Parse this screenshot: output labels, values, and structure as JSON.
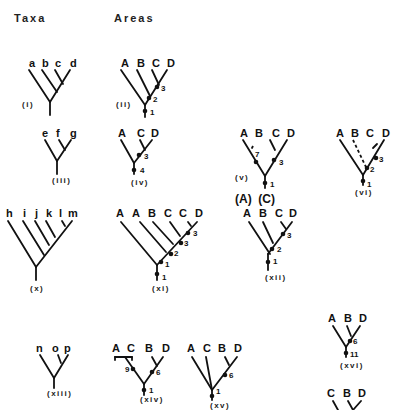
{
  "headers": {
    "taxa": "Taxa",
    "areas": "Areas"
  },
  "trees": [
    {
      "id": "i",
      "caption": "(i)",
      "captionPos": [
        22,
        107
      ],
      "tips": [
        {
          "t": "a",
          "x": 29,
          "y": 67
        },
        {
          "t": "b",
          "x": 42,
          "y": 67
        },
        {
          "t": "c",
          "x": 55,
          "y": 67
        },
        {
          "t": "d",
          "x": 70,
          "y": 67
        }
      ],
      "lines": [
        [
          29,
          70,
          50,
          102
        ],
        [
          42,
          70,
          57,
          92
        ],
        [
          55,
          70,
          63,
          84
        ],
        [
          70,
          70,
          50,
          102
        ],
        [
          50,
          102,
          50,
          115
        ]
      ],
      "dashes": [],
      "dots": [],
      "nums": []
    },
    {
      "id": "ii",
      "caption": "(ii)",
      "captionPos": [
        116,
        107
      ],
      "tips": [
        {
          "t": "A",
          "x": 121,
          "y": 67
        },
        {
          "t": "B",
          "x": 137,
          "y": 67
        },
        {
          "t": "C",
          "x": 152,
          "y": 67
        },
        {
          "t": "D",
          "x": 167,
          "y": 67
        }
      ],
      "lines": [
        [
          121,
          70,
          145,
          105
        ],
        [
          137,
          70,
          150,
          96
        ],
        [
          152,
          70,
          159,
          85
        ],
        [
          167,
          70,
          145,
          105
        ],
        [
          145,
          105,
          145,
          117
        ]
      ],
      "dashes": [],
      "dots": [
        [
          157,
          87
        ],
        [
          149,
          98
        ],
        [
          145,
          111
        ]
      ],
      "nums": [
        {
          "t": "3",
          "x": 161,
          "y": 91
        },
        {
          "t": "2",
          "x": 153,
          "y": 102
        },
        {
          "t": "1",
          "x": 150,
          "y": 115
        }
      ]
    },
    {
      "id": "iii",
      "caption": "(iii)",
      "captionPos": [
        52,
        183
      ],
      "tips": [
        {
          "t": "e",
          "x": 42,
          "y": 137
        },
        {
          "t": "f",
          "x": 56,
          "y": 137
        },
        {
          "t": "g",
          "x": 70,
          "y": 137
        }
      ],
      "lines": [
        [
          45,
          140,
          57,
          161
        ],
        [
          59,
          140,
          65,
          150
        ],
        [
          71,
          140,
          57,
          161
        ],
        [
          57,
          161,
          57,
          174
        ]
      ],
      "dashes": [],
      "dots": [],
      "nums": []
    },
    {
      "id": "iv",
      "caption": "(iv)",
      "captionPos": [
        131,
        185
      ],
      "tips": [
        {
          "t": "A",
          "x": 118,
          "y": 137
        },
        {
          "t": "C",
          "x": 137,
          "y": 137
        },
        {
          "t": "D",
          "x": 151,
          "y": 137
        }
      ],
      "lines": [
        [
          121,
          140,
          134,
          163
        ],
        [
          140,
          140,
          145,
          150
        ],
        [
          152,
          140,
          134,
          163
        ],
        [
          134,
          163,
          134,
          174
        ]
      ],
      "dashes": [],
      "dots": [
        [
          139,
          155
        ],
        [
          134,
          170
        ]
      ],
      "nums": [
        {
          "t": "3",
          "x": 144,
          "y": 159
        },
        {
          "t": "4",
          "x": 140,
          "y": 173
        }
      ]
    },
    {
      "id": "v",
      "caption": "(v)",
      "captionPos": [
        235,
        180
      ],
      "tips": [
        {
          "t": "A",
          "x": 240,
          "y": 137
        },
        {
          "t": "B",
          "x": 255,
          "y": 137
        },
        {
          "t": "C",
          "x": 272,
          "y": 137
        },
        {
          "t": "D",
          "x": 287,
          "y": 137
        }
      ],
      "lines": [
        [
          243,
          140,
          265,
          176
        ],
        [
          270,
          140,
          275,
          150
        ],
        [
          287,
          140,
          265,
          176
        ],
        [
          265,
          176,
          265,
          188
        ]
      ],
      "dashes": [
        [
          253,
          146,
          251,
          150
        ]
      ],
      "dots": [
        [
          256,
          162
        ],
        [
          274,
          160
        ],
        [
          265,
          183
        ]
      ],
      "nums": [
        {
          "t": "7",
          "x": 255,
          "y": 157
        },
        {
          "t": "3",
          "x": 279,
          "y": 165
        },
        {
          "t": "1",
          "x": 270,
          "y": 187
        }
      ]
    },
    {
      "id": "vi",
      "caption": "(vi)",
      "captionPos": [
        355,
        195
      ],
      "tips": [
        {
          "t": "A",
          "x": 336,
          "y": 137
        },
        {
          "t": "B",
          "x": 351,
          "y": 137
        },
        {
          "t": "C",
          "x": 366,
          "y": 137
        },
        {
          "t": "D",
          "x": 382,
          "y": 137
        }
      ],
      "lines": [
        [
          340,
          140,
          363,
          175
        ],
        [
          373,
          148,
          377,
          144
        ],
        [
          384,
          140,
          363,
          175
        ],
        [
          363,
          175,
          363,
          185
        ]
      ],
      "dashes": [
        [
          353,
          140,
          366,
          167
        ]
      ],
      "dots": [
        [
          376,
          158
        ],
        [
          367,
          168
        ],
        [
          363,
          181
        ]
      ],
      "nums": [
        {
          "t": "3",
          "x": 379,
          "y": 162
        },
        {
          "t": "2",
          "x": 370,
          "y": 172
        },
        {
          "t": "1",
          "x": 367,
          "y": 187
        }
      ]
    },
    {
      "id": "x",
      "caption": "(x)",
      "captionPos": [
        30,
        291
      ],
      "tips": [
        {
          "t": "h",
          "x": 6,
          "y": 217
        },
        {
          "t": "i",
          "x": 23,
          "y": 217
        },
        {
          "t": "j",
          "x": 35,
          "y": 217
        },
        {
          "t": "k",
          "x": 46,
          "y": 217
        },
        {
          "t": "l",
          "x": 59,
          "y": 217
        },
        {
          "t": "m",
          "x": 68,
          "y": 217
        }
      ],
      "lines": [
        [
          8,
          221,
          36,
          267
        ],
        [
          23,
          221,
          44,
          255
        ],
        [
          35,
          221,
          49,
          245
        ],
        [
          46,
          221,
          55,
          237
        ],
        [
          62,
          221,
          65,
          226
        ],
        [
          72,
          221,
          36,
          267
        ],
        [
          36,
          267,
          36,
          280
        ]
      ],
      "dashes": [],
      "dots": [],
      "nums": []
    },
    {
      "id": "xi",
      "caption": "(xi)",
      "captionPos": [
        152,
        291
      ],
      "tips": [
        {
          "t": "A",
          "x": 116,
          "y": 217
        },
        {
          "t": "A",
          "x": 132,
          "y": 217
        },
        {
          "t": "B",
          "x": 148,
          "y": 217
        },
        {
          "t": "C",
          "x": 164,
          "y": 217
        },
        {
          "t": "C",
          "x": 179,
          "y": 217
        },
        {
          "t": "D",
          "x": 195,
          "y": 217
        }
      ],
      "lines": [
        [
          121,
          222,
          157,
          265
        ],
        [
          140,
          222,
          166,
          252
        ],
        [
          153,
          222,
          173,
          244
        ],
        [
          170,
          222,
          180,
          236
        ],
        [
          188,
          222,
          191,
          226
        ],
        [
          197,
          222,
          157,
          265
        ],
        [
          157,
          265,
          157,
          280
        ]
      ],
      "dashes": [],
      "dots": [
        [
          188,
          233
        ],
        [
          181,
          243
        ],
        [
          171,
          254
        ],
        [
          161,
          262
        ],
        [
          157,
          274
        ]
      ],
      "nums": [
        {
          "t": "3",
          "x": 193,
          "y": 236
        },
        {
          "t": "3",
          "x": 184,
          "y": 246
        },
        {
          "t": "2",
          "x": 174,
          "y": 256
        },
        {
          "t": "1",
          "x": 165,
          "y": 267
        },
        {
          "t": "1",
          "x": 162,
          "y": 280
        }
      ]
    },
    {
      "id": "xii",
      "caption": "(xii)",
      "captionPos": [
        265,
        280
      ],
      "tips": [
        {
          "t": "A",
          "x": 243,
          "y": 217
        },
        {
          "t": "B",
          "x": 259,
          "y": 217
        },
        {
          "t": "C",
          "x": 275,
          "y": 217
        },
        {
          "t": "D",
          "x": 289,
          "y": 217
        }
      ],
      "lines": [
        [
          249,
          222,
          270,
          254
        ],
        [
          263,
          222,
          273,
          243
        ],
        [
          281,
          222,
          286,
          229
        ],
        [
          292,
          222,
          268,
          254
        ],
        [
          268,
          254,
          268,
          270
        ]
      ],
      "dashes": [],
      "dots": [
        [
          283,
          234
        ],
        [
          272,
          249
        ],
        [
          268,
          262
        ]
      ],
      "nums": [
        {
          "t": "3",
          "x": 287,
          "y": 238
        },
        {
          "t": "2",
          "x": 277,
          "y": 252
        },
        {
          "t": "1",
          "x": 273,
          "y": 264
        }
      ]
    },
    {
      "id": "xiii",
      "caption": "(xiii)",
      "captionPos": [
        47,
        396
      ],
      "tips": [
        {
          "t": "n",
          "x": 36,
          "y": 352
        },
        {
          "t": "o",
          "x": 52,
          "y": 352
        },
        {
          "t": "p",
          "x": 64,
          "y": 352
        }
      ],
      "lines": [
        [
          40,
          355,
          54,
          378
        ],
        [
          58,
          355,
          61,
          363
        ],
        [
          68,
          355,
          54,
          378
        ],
        [
          54,
          378,
          54,
          388
        ]
      ],
      "dashes": [],
      "dots": [],
      "nums": []
    },
    {
      "id": "xiv",
      "caption": "(xiv)",
      "captionPos": [
        140,
        402
      ],
      "tips": [
        {
          "t": "A",
          "x": 112,
          "y": 352
        },
        {
          "t": "C",
          "x": 127,
          "y": 352
        },
        {
          "t": "B",
          "x": 145,
          "y": 352
        },
        {
          "t": "D",
          "x": 162,
          "y": 352
        }
      ],
      "lines": [
        [
          115,
          357,
          132,
          357
        ],
        [
          115,
          357,
          115,
          360
        ],
        [
          132,
          357,
          132,
          360
        ],
        [
          125,
          357,
          144,
          384
        ],
        [
          152,
          357,
          157,
          366
        ],
        [
          163,
          357,
          144,
          384
        ],
        [
          144,
          384,
          144,
          395
        ]
      ],
      "dashes": [],
      "dots": [
        [
          133,
          369
        ],
        [
          152,
          372
        ],
        [
          144,
          390
        ]
      ],
      "nums": [
        {
          "t": "9",
          "x": 125,
          "y": 372
        },
        {
          "t": "6",
          "x": 156,
          "y": 375
        },
        {
          "t": "1",
          "x": 149,
          "y": 393
        }
      ]
    },
    {
      "id": "xv",
      "caption": "(xv)",
      "captionPos": [
        210,
        408
      ],
      "tips": [
        {
          "t": "A",
          "x": 187,
          "y": 352
        },
        {
          "t": "C",
          "x": 203,
          "y": 352
        },
        {
          "t": "B",
          "x": 218,
          "y": 352
        },
        {
          "t": "D",
          "x": 234,
          "y": 352
        }
      ],
      "lines": [
        [
          192,
          357,
          212,
          390
        ],
        [
          206,
          357,
          212,
          390
        ],
        [
          225,
          357,
          229,
          365
        ],
        [
          237,
          357,
          212,
          390
        ],
        [
          212,
          390,
          212,
          400
        ]
      ],
      "dashes": [],
      "dots": [
        [
          225,
          375
        ],
        [
          212,
          396
        ]
      ],
      "nums": [
        {
          "t": "6",
          "x": 229,
          "y": 378
        },
        {
          "t": "1",
          "x": 216,
          "y": 394
        }
      ]
    },
    {
      "id": "xvi",
      "caption": "(xvi)",
      "captionPos": [
        340,
        368
      ],
      "tips": [
        {
          "t": "A",
          "x": 328,
          "y": 322
        },
        {
          "t": "B",
          "x": 344,
          "y": 322
        },
        {
          "t": "D",
          "x": 359,
          "y": 322
        }
      ],
      "lines": [
        [
          333,
          326,
          346,
          347
        ],
        [
          347,
          326,
          351,
          336
        ],
        [
          360,
          326,
          346,
          347
        ],
        [
          346,
          347,
          346,
          357
        ]
      ],
      "dashes": [],
      "dots": [
        [
          350,
          341
        ],
        [
          346,
          353
        ]
      ],
      "nums": [
        {
          "t": "6",
          "x": 353,
          "y": 344
        },
        {
          "t": "11",
          "x": 350,
          "y": 357
        }
      ]
    },
    {
      "id": "xvii-partial",
      "caption": "",
      "captionPos": [
        0,
        0
      ],
      "tips": [
        {
          "t": "C",
          "x": 327,
          "y": 397
        },
        {
          "t": "B",
          "x": 343,
          "y": 397
        },
        {
          "t": "D",
          "x": 358,
          "y": 397
        }
      ],
      "lines": [
        [
          333,
          401,
          338,
          410
        ],
        [
          348,
          401,
          353,
          410
        ],
        [
          361,
          401,
          353,
          410
        ]
      ],
      "dashes": [],
      "dots": [],
      "nums": []
    }
  ],
  "annotations": [
    {
      "t": "(A)  (C)",
      "x": 235,
      "y": 203
    }
  ]
}
